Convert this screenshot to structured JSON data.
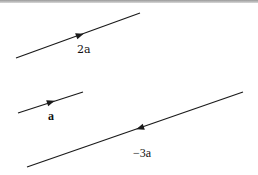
{
  "diagram": {
    "title": "",
    "colors": {
      "line": "#1a1a1a",
      "background": "#ffffff",
      "top_border": "#a0a0a0"
    },
    "vectors": [
      {
        "id": "two-a",
        "label": "2a",
        "start": [
          16,
          58
        ],
        "end": [
          140,
          13
        ],
        "arrow_at": [
          80,
          35
        ],
        "arrow_direction": "forward",
        "label_pos": [
          77,
          44
        ]
      },
      {
        "id": "a",
        "label": "a",
        "start": [
          18,
          113
        ],
        "end": [
          83,
          92
        ],
        "arrow_at": [
          51,
          102
        ],
        "arrow_direction": "forward",
        "label_pos": [
          48,
          110
        ]
      },
      {
        "id": "minus-three-a",
        "label": "−3a",
        "start": [
          27,
          167
        ],
        "end": [
          243,
          92
        ],
        "arrow_at": [
          140,
          128
        ],
        "arrow_direction": "backward",
        "label_pos": [
          133,
          147
        ]
      }
    ]
  }
}
